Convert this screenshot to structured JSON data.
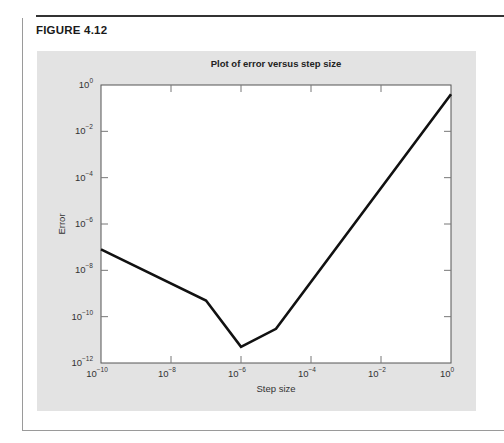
{
  "figure": {
    "label": "FIGURE 4.12"
  },
  "chart_data": {
    "type": "line",
    "title": "Plot of error versus step size",
    "xlabel": "Step size",
    "ylabel": "Error",
    "xscale": "log",
    "yscale": "log",
    "xlim": [
      1e-10,
      1
    ],
    "ylim": [
      1e-12,
      1
    ],
    "grid": false,
    "legend": null,
    "x_ticks": [
      {
        "value": 1e-10,
        "base": "10",
        "exp": "−10"
      },
      {
        "value": 1e-08,
        "base": "10",
        "exp": "−8"
      },
      {
        "value": 1e-06,
        "base": "10",
        "exp": "−6"
      },
      {
        "value": 0.0001,
        "base": "10",
        "exp": "−4"
      },
      {
        "value": 0.01,
        "base": "10",
        "exp": "−2"
      },
      {
        "value": 1,
        "base": "10",
        "exp": "0"
      }
    ],
    "y_ticks": [
      {
        "value": 1,
        "base": "10",
        "exp": "0"
      },
      {
        "value": 0.01,
        "base": "10",
        "exp": "−2"
      },
      {
        "value": 0.0001,
        "base": "10",
        "exp": "−4"
      },
      {
        "value": 1e-06,
        "base": "10",
        "exp": "−6"
      },
      {
        "value": 1e-08,
        "base": "10",
        "exp": "−8"
      },
      {
        "value": 1e-10,
        "base": "10",
        "exp": "−10"
      },
      {
        "value": 1e-12,
        "base": "10",
        "exp": "−12"
      }
    ],
    "series": [
      {
        "name": "Error",
        "color": "#111111",
        "x": [
          1e-10,
          1e-07,
          1e-06,
          1e-05,
          1
        ],
        "y": [
          8e-08,
          5e-10,
          5e-12,
          3e-11,
          0.4
        ]
      }
    ]
  },
  "colors": {
    "panel_background": "#e3e3e3",
    "plot_background": "#ffffff",
    "line": "#111111"
  }
}
